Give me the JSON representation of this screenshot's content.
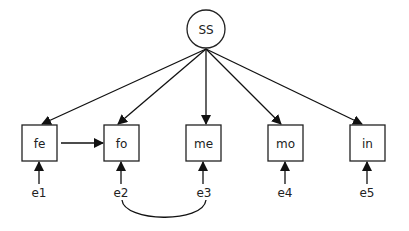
{
  "diagram": {
    "type": "path-diagram",
    "latent": {
      "id": "SS",
      "label": "SS"
    },
    "observed": [
      {
        "id": "fe",
        "label": "fe"
      },
      {
        "id": "fo",
        "label": "fo"
      },
      {
        "id": "me",
        "label": "me"
      },
      {
        "id": "mo",
        "label": "mo"
      },
      {
        "id": "in",
        "label": "in"
      }
    ],
    "errors": [
      {
        "id": "e1",
        "label": "e1",
        "target": "fe"
      },
      {
        "id": "e2",
        "label": "e2",
        "target": "fo"
      },
      {
        "id": "e3",
        "label": "e3",
        "target": "me"
      },
      {
        "id": "e4",
        "label": "e4",
        "target": "mo"
      },
      {
        "id": "e5",
        "label": "e5",
        "target": "in"
      }
    ],
    "paths": [
      {
        "from": "SS",
        "to": "fe"
      },
      {
        "from": "SS",
        "to": "fo"
      },
      {
        "from": "SS",
        "to": "me"
      },
      {
        "from": "SS",
        "to": "mo"
      },
      {
        "from": "SS",
        "to": "in"
      },
      {
        "from": "fe",
        "to": "fo"
      }
    ],
    "covariances": [
      {
        "between": [
          "e2",
          "e3"
        ]
      }
    ]
  }
}
